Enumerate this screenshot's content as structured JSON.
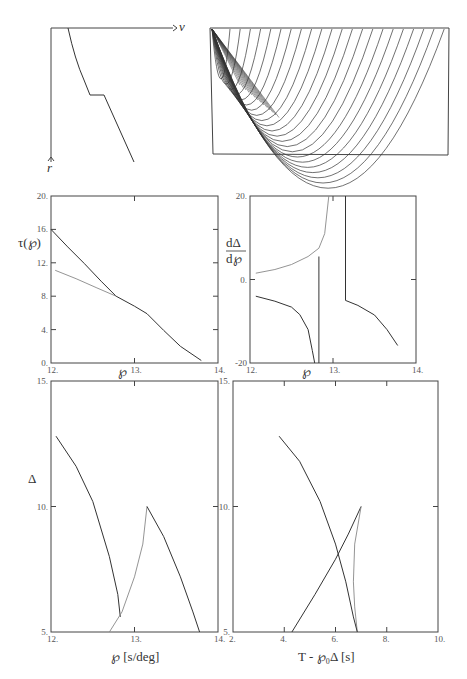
{
  "velocity_sketch": {
    "x_axis_label": "v",
    "y_axis_label": "r"
  },
  "ray_diagram": {
    "description": "Rays from surface source turning in the mantle, triplication"
  },
  "chart_data": [
    {
      "id": "tau_p",
      "type": "line",
      "title": "",
      "xlabel": "℘",
      "ylabel": "τ(℘)",
      "xlim": [
        12,
        14
      ],
      "ylim": [
        0,
        20
      ],
      "xticks": [
        "12.",
        "13.",
        "14."
      ],
      "yticks": [
        "0.",
        "4.",
        "8.",
        "12.",
        "16.",
        "20."
      ],
      "series": [
        {
          "name": "tau-dark",
          "color": "#333333",
          "x": [
            12.0,
            12.2,
            12.4,
            12.6,
            12.78,
            13.0,
            13.15,
            13.35,
            13.55,
            13.8
          ],
          "y": [
            16.0,
            13.9,
            11.9,
            9.8,
            8.0,
            6.8,
            5.9,
            3.9,
            2.0,
            0.3
          ]
        },
        {
          "name": "tau-light",
          "color": "#888888",
          "x": [
            12.05,
            12.3,
            12.55,
            12.78
          ],
          "y": [
            11.1,
            10.1,
            9.0,
            8.0
          ]
        }
      ]
    },
    {
      "id": "dDelta_dp",
      "type": "line",
      "xlabel": "℘",
      "ylabel": "dΔ/d℘",
      "xlim": [
        12,
        14
      ],
      "ylim": [
        -20,
        20
      ],
      "xticks": [
        "12.",
        "13.",
        "14."
      ],
      "yticks": [
        "-20",
        "0.",
        "20."
      ],
      "series": [
        {
          "name": "deriv-light",
          "color": "#888888",
          "x": [
            12.07,
            12.3,
            12.5,
            12.7,
            12.83,
            12.9,
            12.95
          ],
          "y": [
            1.5,
            2.4,
            3.6,
            5.5,
            7.5,
            11.0,
            20.0
          ]
        },
        {
          "name": "deriv-dark-left",
          "color": "#333333",
          "x": [
            12.07,
            12.3,
            12.5,
            12.6,
            12.7,
            12.75,
            12.78
          ],
          "y": [
            -4.0,
            -5.2,
            -6.6,
            -8.4,
            -12.0,
            -17.0,
            -20.0
          ]
        },
        {
          "name": "deriv-dark-vertical",
          "color": "#333333",
          "x": [
            12.83,
            12.83
          ],
          "y": [
            5.5,
            -20.0
          ]
        },
        {
          "name": "deriv-dark-right",
          "color": "#333333",
          "x": [
            13.15,
            13.15,
            13.3,
            13.5,
            13.65,
            13.78
          ],
          "y": [
            20.0,
            -5.0,
            -6.2,
            -8.5,
            -12.0,
            -15.8
          ]
        }
      ]
    },
    {
      "id": "Delta_p",
      "type": "line",
      "xlabel": "℘ [s/deg]",
      "ylabel": "Δ",
      "xlim": [
        12,
        14
      ],
      "ylim": [
        5,
        15
      ],
      "xticks": [
        "12.",
        "13.",
        "14."
      ],
      "yticks": [
        "5.",
        "10.",
        "15."
      ],
      "series": [
        {
          "name": "delta-dark-1",
          "color": "#333333",
          "x": [
            12.06,
            12.3,
            12.5,
            12.7,
            12.8,
            12.83
          ],
          "y": [
            12.8,
            11.6,
            10.2,
            8.0,
            6.5,
            5.6
          ]
        },
        {
          "name": "delta-light",
          "color": "#888888",
          "x": [
            12.7,
            12.85,
            13.0,
            13.1,
            13.15
          ],
          "y": [
            5.0,
            5.8,
            7.2,
            8.5,
            10.0
          ]
        },
        {
          "name": "delta-dark-2",
          "color": "#333333",
          "x": [
            13.15,
            13.35,
            13.55,
            13.7,
            13.78
          ],
          "y": [
            10.0,
            8.8,
            7.2,
            5.8,
            5.0
          ]
        }
      ]
    },
    {
      "id": "Delta_T",
      "type": "line",
      "xlabel": "T - ℘₀Δ [s]",
      "ylabel": "",
      "xlim": [
        2,
        10
      ],
      "ylim": [
        5,
        15
      ],
      "xticks": [
        "2.",
        "4.",
        "6.",
        "8.",
        "10."
      ],
      "yticks": [
        "5.",
        "10.",
        "15."
      ],
      "series": [
        {
          "name": "reduced-dark-1",
          "color": "#333333",
          "x": [
            3.8,
            4.6,
            5.4,
            6.0,
            6.4,
            6.7
          ],
          "y": [
            12.8,
            11.8,
            10.2,
            8.5,
            7.0,
            5.6
          ]
        },
        {
          "name": "reduced-dark-2",
          "color": "#333333",
          "x": [
            4.3,
            5.2,
            6.0,
            6.5,
            7.0
          ],
          "y": [
            5.0,
            6.5,
            7.9,
            8.9,
            10.0
          ]
        },
        {
          "name": "reduced-light",
          "color": "#888888",
          "x": [
            7.0,
            6.75,
            6.7,
            6.75,
            6.85
          ],
          "y": [
            10.0,
            8.5,
            7.0,
            6.0,
            5.0
          ]
        },
        {
          "name": "reduced-dark-tail",
          "color": "#333333",
          "x": [
            6.7,
            6.85
          ],
          "y": [
            5.6,
            5.0
          ]
        }
      ]
    }
  ]
}
